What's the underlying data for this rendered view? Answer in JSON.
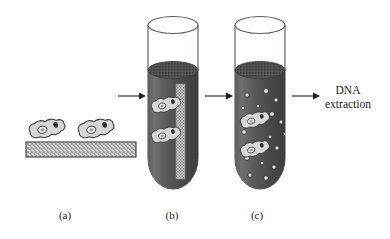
{
  "figure": {
    "background_color": "#ffffff",
    "width": 390,
    "height": 239
  },
  "panels": [
    {
      "id": "a",
      "label": "(a)",
      "label_x": 65,
      "label_y": 219,
      "description": "Cells adhered to a hatched substrate slab",
      "cell_count": 2,
      "substrate": {
        "name": "hatched-substrate-bar",
        "x": 26,
        "y": 142,
        "width": 110,
        "height": 15,
        "fill_pattern": "cross-hatch",
        "pattern_color": "#8a8a8a",
        "outline_color": "#4a4a4a"
      },
      "cells": [
        {
          "cx": 47,
          "cy": 130,
          "rotation": -12
        },
        {
          "cx": 96,
          "cy": 130,
          "rotation": -12
        }
      ]
    },
    {
      "id": "b",
      "label": "(b)",
      "label_x": 172,
      "label_y": 219,
      "description": "Substrate with attached cells immersed in dark buffer inside a test tube",
      "tube": {
        "name": "test-tube-b",
        "left": 148,
        "top": 14,
        "width": 50,
        "height": 175,
        "rim_color": "#555555",
        "glass_color": "#777777",
        "liquid_top_y": 70,
        "liquid_color_light": "#6e6e6e",
        "liquid_color_dark": "#434343",
        "meniscus_color": "#4a4a4a"
      },
      "strip": {
        "name": "vertical-substrate-strip",
        "x": 176,
        "y": 84,
        "width": 9,
        "height": 95,
        "pattern": "stipple-checker",
        "color": "#d8d8d8"
      },
      "cells": [
        {
          "cx": 166,
          "cy": 106,
          "rotation": -14
        },
        {
          "cx": 166,
          "cy": 136,
          "rotation": -14
        }
      ]
    },
    {
      "id": "c",
      "label": "(c)",
      "label_x": 257,
      "label_y": 219,
      "description": "Cells released with substrate fragments dispersed in the buffer",
      "tube": {
        "name": "test-tube-c",
        "left": 235,
        "top": 14,
        "width": 50,
        "height": 175,
        "rim_color": "#555555",
        "glass_color": "#777777",
        "liquid_top_y": 70,
        "liquid_color_light": "#6e6e6e",
        "liquid_color_dark": "#434343",
        "meniscus_color": "#4a4a4a"
      },
      "cells": [
        {
          "cx": 255,
          "cy": 121,
          "rotation": -16
        },
        {
          "cx": 255,
          "cy": 150,
          "rotation": -16
        }
      ],
      "fragments": [
        {
          "cx": 247,
          "cy": 95,
          "r": 2.1
        },
        {
          "cx": 266,
          "cy": 91,
          "r": 2.4
        },
        {
          "cx": 276,
          "cy": 100,
          "r": 2.0
        },
        {
          "cx": 243,
          "cy": 108,
          "r": 1.7
        },
        {
          "cx": 272,
          "cy": 114,
          "r": 2.3
        },
        {
          "cx": 281,
          "cy": 122,
          "r": 1.9
        },
        {
          "cx": 244,
          "cy": 132,
          "r": 2.2
        },
        {
          "cx": 270,
          "cy": 137,
          "r": 1.8
        },
        {
          "cx": 277,
          "cy": 148,
          "r": 2.0
        },
        {
          "cx": 247,
          "cy": 158,
          "r": 2.3
        },
        {
          "cx": 262,
          "cy": 163,
          "r": 1.8
        },
        {
          "cx": 274,
          "cy": 167,
          "r": 2.1
        },
        {
          "cx": 250,
          "cy": 175,
          "r": 2.0
        },
        {
          "cx": 266,
          "cy": 178,
          "r": 2.2
        },
        {
          "cx": 258,
          "cy": 106,
          "r": 1.6
        },
        {
          "cx": 285,
          "cy": 134,
          "r": 1.7
        }
      ]
    }
  ],
  "arrows": [
    {
      "name": "arrow-a-to-b",
      "x1": 118,
      "y1": 96,
      "x2": 142,
      "y2": 96
    },
    {
      "name": "arrow-b-to-c",
      "x1": 205,
      "y1": 96,
      "x2": 229,
      "y2": 96
    },
    {
      "name": "arrow-c-to-extraction",
      "x1": 292,
      "y1": 96,
      "x2": 316,
      "y2": 96
    }
  ],
  "process": {
    "name": "dna-extraction-step",
    "lines": [
      "DNA",
      "extraction"
    ],
    "line1": "DNA",
    "line2": "extraction",
    "x": 348,
    "line1_y": 94,
    "line2_y": 108
  },
  "colors": {
    "background": "#ffffff",
    "ink": "#1a1a1a",
    "tube_glass": "#777777",
    "liquid_dark": "#434343",
    "liquid_light": "#6e6e6e",
    "cell_fill": "#d5d5d5",
    "cell_outline": "#3c3c3c",
    "nucleus": "#2b2b2b",
    "substrate_hatch": "#8a8a8a",
    "fragment": "#e2e2e2"
  }
}
